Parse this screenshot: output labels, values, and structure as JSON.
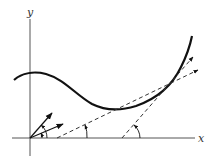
{
  "diagram": {
    "axes": {
      "x_label": "x",
      "y_label": "y"
    },
    "colors": {
      "stroke": "#111111",
      "axis": "#555555",
      "background": "#ffffff"
    },
    "elements": {
      "curve": "smooth S-shaped curve: local max near left, local min in middle, steep rise at right",
      "tangent_lines": [
        {
          "name": "tangent-line-1",
          "style": "dashed",
          "from_x_axis_point": [
            57,
            138
          ],
          "arrow_end": [
            198,
            70
          ]
        },
        {
          "name": "tangent-line-2",
          "style": "dashed",
          "from_x_axis_point": [
            122,
            138
          ],
          "arrow_end": [
            193,
            57
          ]
        }
      ],
      "origin_vectors": [
        {
          "name": "vector-steep",
          "to": [
            52,
            113
          ]
        },
        {
          "name": "vector-shallow",
          "to": [
            63,
            124
          ]
        }
      ],
      "angle_arcs": 4
    }
  }
}
